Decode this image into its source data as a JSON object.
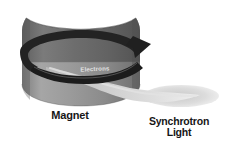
{
  "figure": {
    "background_color": "#ffffff",
    "labels": {
      "magnet": "Magnet",
      "synchrotron_light_line1": "Synchrotron",
      "synchrotron_light_line2": "Light",
      "orbit_band": "Electrons"
    },
    "colors": {
      "magnet_top_dark": "#6e6e6e",
      "magnet_body_mid": "#8d8d8d",
      "magnet_body_light": "#a2a2a2",
      "magnet_shadow": "#5c5c5c",
      "orbit_band_dark": "#1f1f1f",
      "orbit_band_text": "#e2e2e2",
      "beam_core": "#cfcfcf",
      "beam_edge": "#e8e8e8",
      "label_text": "#161616"
    },
    "elements": {
      "magnet_shape": "cylindrical dipole magnet with concave saddle top",
      "orbit_arrow": "elliptical electron orbit band with arrowhead pointing up-right",
      "light_cone": "tapered synchrotron light beam fanning to the right"
    }
  }
}
